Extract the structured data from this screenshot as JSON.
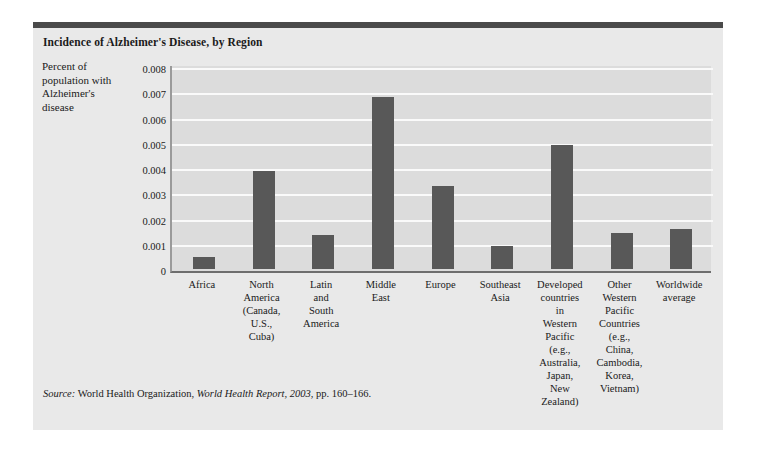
{
  "figure": {
    "title": "Incidence of Alzheimer's Disease, by Region",
    "y_axis_title_lines": [
      "Percent of",
      "population with",
      "Alzheimer's",
      "disease"
    ],
    "source": {
      "label": "Source:",
      "organization": " World Health Organization, ",
      "publication": "World Health Report, 2003",
      "pages": ", pp. 160–166."
    },
    "colors": {
      "card_background": "#e9e9e9",
      "top_rule": "#4a4a4a",
      "plot_background": "#dcdcdc",
      "gridline": "#fafafa",
      "bar": "#585858",
      "text": "#1a1a1a"
    }
  },
  "chart_data": {
    "type": "bar",
    "title": "Incidence of Alzheimer's Disease, by Region",
    "xlabel": "",
    "ylabel": "Percent of population with Alzheimer's disease",
    "ylim": [
      0,
      0.008
    ],
    "yticks": [
      0,
      0.001,
      0.002,
      0.003,
      0.004,
      0.005,
      0.006,
      0.007,
      0.008
    ],
    "ytick_labels": [
      "0",
      "0.001",
      "0.002",
      "0.003",
      "0.004",
      "0.005",
      "0.006",
      "0.007",
      "0.008"
    ],
    "grid": true,
    "legend": "none",
    "categories": [
      "Africa",
      "North America (Canada, U.S., Cuba)",
      "Latin and South America",
      "Middle East",
      "Europe",
      "Southeast Asia",
      "Developed countries in Western Pacific (e.g., Australia, Japan, New Zealand)",
      "Other Western Pacific Countries (e.g., China, Cambodia, Korea, Vietnam)",
      "Worldwide average"
    ],
    "category_label_lines": [
      [
        "Africa"
      ],
      [
        "North",
        "America",
        "(Canada,",
        "U.S.,",
        "Cuba)"
      ],
      [
        "Latin",
        "and",
        "South",
        "America"
      ],
      [
        "Middle",
        "East"
      ],
      [
        "Europe"
      ],
      [
        "Southeast",
        "Asia"
      ],
      [
        "Developed",
        "countries",
        "in",
        "Western",
        "Pacific",
        "(e.g.,",
        "Australia,",
        "Japan,",
        "New",
        "Zealand)"
      ],
      [
        "Other",
        "Western",
        "Pacific",
        "Countries",
        "(e.g.,",
        "China,",
        "Cambodia,",
        "Korea,",
        "Vietnam)"
      ],
      [
        "Worldwide",
        "average"
      ]
    ],
    "values": [
      0.00048,
      0.0039,
      0.00135,
      0.0068,
      0.0033,
      0.00092,
      0.0049,
      0.00142,
      0.00158
    ]
  }
}
